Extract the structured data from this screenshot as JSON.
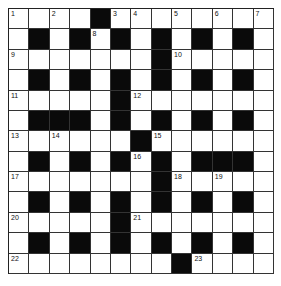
{
  "puzzle": {
    "rows": 13,
    "cols": 13,
    "colors": {
      "block": "#0a0a0a",
      "cell": "#ffffff",
      "line": "#333333"
    },
    "grid": [
      "....#........",
      ".#.#.#.#.#.#.",
      ".......#.....",
      ".#.#.#.#.#.#.",
      ".....#.......",
      ".###.#.#.#.#.",
      "......#......",
      ".#.#.#.#.###.",
      ".......#.....",
      ".#.#.#.#.#.#.",
      ".....#.......",
      ".#.#.#.#.#.#.",
      "........#...."
    ],
    "numbers": [
      {
        "r": 0,
        "c": 0,
        "n": "1"
      },
      {
        "r": 0,
        "c": 2,
        "n": "2"
      },
      {
        "r": 0,
        "c": 5,
        "n": "3"
      },
      {
        "r": 0,
        "c": 6,
        "n": "4"
      },
      {
        "r": 0,
        "c": 8,
        "n": "5"
      },
      {
        "r": 0,
        "c": 10,
        "n": "6"
      },
      {
        "r": 0,
        "c": 12,
        "n": "7"
      },
      {
        "r": 1,
        "c": 4,
        "n": "8"
      },
      {
        "r": 2,
        "c": 0,
        "n": "9"
      },
      {
        "r": 2,
        "c": 8,
        "n": "10"
      },
      {
        "r": 4,
        "c": 0,
        "n": "11"
      },
      {
        "r": 4,
        "c": 6,
        "n": "12"
      },
      {
        "r": 6,
        "c": 0,
        "n": "13"
      },
      {
        "r": 6,
        "c": 2,
        "n": "14"
      },
      {
        "r": 6,
        "c": 7,
        "n": "15"
      },
      {
        "r": 7,
        "c": 6,
        "n": "16"
      },
      {
        "r": 8,
        "c": 0,
        "n": "17"
      },
      {
        "r": 8,
        "c": 8,
        "n": "18"
      },
      {
        "r": 8,
        "c": 10,
        "n": "19"
      },
      {
        "r": 10,
        "c": 0,
        "n": "20"
      },
      {
        "r": 10,
        "c": 6,
        "n": "21"
      },
      {
        "r": 12,
        "c": 0,
        "n": "22"
      },
      {
        "r": 12,
        "c": 9,
        "n": "23"
      }
    ]
  }
}
